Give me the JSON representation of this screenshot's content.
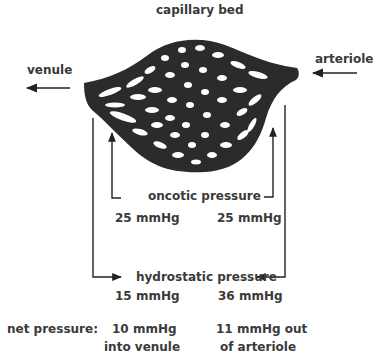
{
  "title": "capillary bed",
  "labels": {
    "venule": "venule",
    "arteriole": "arteriole",
    "oncotic": "oncotic pressure",
    "hydrostatic": "hydrostatic pressure",
    "net": "net pressure:"
  },
  "oncotic_values": {
    "venule_side": "25 mmHg",
    "arteriole_side": "25 mmHg"
  },
  "hydrostatic_values": {
    "venule_side": "15 mmHg",
    "arteriole_side": "36 mmHg"
  },
  "net_values": {
    "venule_side_line1": "10 mmHg",
    "venule_side_line2": "into venule",
    "arteriole_side_line1": "11 mmHg out",
    "arteriole_side_line2": "of arteriole"
  },
  "colors": {
    "vessel": "#2b2b2b",
    "text": "#3a3a3a",
    "line": "#222222"
  }
}
